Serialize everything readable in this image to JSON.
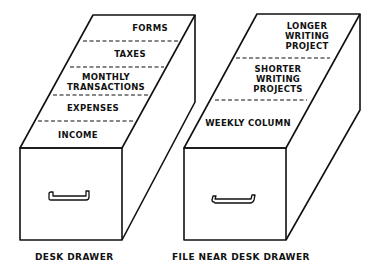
{
  "left_drawer": {
    "caption": "DESK DRAWER",
    "sections": [
      {
        "line1": "FORMS",
        "line2": ""
      },
      {
        "line1": "TAXES",
        "line2": ""
      },
      {
        "line1": "MONTHLY",
        "line2": "TRANSACTIONS"
      },
      {
        "line1": "EXPENSES",
        "line2": ""
      },
      {
        "line1": "INCOME",
        "line2": ""
      }
    ]
  },
  "right_drawer": {
    "caption": "FILE NEAR DESK DRAWER",
    "sections": [
      {
        "line1": "LONGER",
        "line2": "WRITING",
        "line3": "PROJECT"
      },
      {
        "line1": "SHORTER",
        "line2": "WRITING",
        "line3": "PROJECTS"
      },
      {
        "line1": "WEEKLY COLUMN",
        "line2": "",
        "line3": ""
      }
    ]
  },
  "colors": {
    "line": "#111111",
    "background": "#ffffff"
  }
}
